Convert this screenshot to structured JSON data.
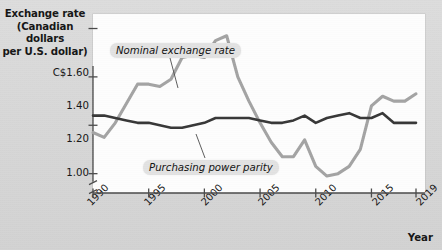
{
  "chart_data": {
    "type": "line",
    "title": "",
    "ylabel": "Exchange rate (Canadian dollars per U.S. dollar)",
    "ylabel_lines": [
      "Exchange rate",
      "(Canadian dollars",
      "per U.S. dollar)"
    ],
    "xlabel": "Year",
    "xlim": [
      1990,
      2019
    ],
    "ylim": [
      0.92,
      1.66
    ],
    "axis_break_y": true,
    "grid": false,
    "legend_position": "inline-annotations",
    "ytick_values": [
      1.6,
      1.4,
      1.2,
      1.0
    ],
    "ytick_labels": [
      "C$1.60",
      "1.40",
      "1.20",
      "1.00"
    ],
    "xtick_values": [
      1990,
      1995,
      2000,
      2005,
      2010,
      2015,
      2019
    ],
    "xtick_labels": [
      "1990",
      "1995",
      "2000",
      "2005",
      "2010",
      "2015",
      "2019"
    ],
    "x": [
      1990,
      1991,
      1992,
      1993,
      1994,
      1995,
      1996,
      1997,
      1998,
      1999,
      2000,
      2001,
      2002,
      2003,
      2004,
      2005,
      2006,
      2007,
      2008,
      2009,
      2010,
      2011,
      2012,
      2013,
      2014,
      2015,
      2016,
      2017,
      2018,
      2019
    ],
    "series": [
      {
        "name": "Nominal exchange rate",
        "color": "#a3a3a3",
        "width": 3.1,
        "values": [
          1.17,
          1.15,
          1.21,
          1.29,
          1.37,
          1.37,
          1.36,
          1.39,
          1.48,
          1.49,
          1.48,
          1.55,
          1.57,
          1.4,
          1.3,
          1.21,
          1.13,
          1.07,
          1.07,
          1.14,
          1.03,
          0.99,
          1.0,
          1.03,
          1.1,
          1.28,
          1.32,
          1.3,
          1.3,
          1.33
        ]
      },
      {
        "name": "Purchasing power parity",
        "color": "#363636",
        "width": 2.6,
        "values": [
          1.24,
          1.24,
          1.23,
          1.22,
          1.21,
          1.21,
          1.2,
          1.19,
          1.19,
          1.2,
          1.21,
          1.23,
          1.23,
          1.23,
          1.23,
          1.22,
          1.21,
          1.21,
          1.22,
          1.24,
          1.21,
          1.23,
          1.24,
          1.25,
          1.23,
          1.23,
          1.25,
          1.21,
          1.21,
          1.21
        ]
      }
    ],
    "annotations": [
      {
        "text": "Nominal exchange rate",
        "points_to_series": "Nominal exchange rate"
      },
      {
        "text": "Purchasing power parity",
        "points_to_series": "Purchasing power parity"
      }
    ]
  }
}
